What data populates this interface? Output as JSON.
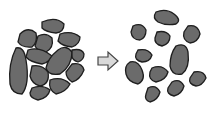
{
  "illustration": {
    "description": "Crowded cluster of gray blob characters transforms into spaced-apart smiling blobs",
    "left_group": {
      "label": "crowded-cells",
      "count": 13
    },
    "arrow": {
      "direction": "right"
    },
    "right_group": {
      "label": "separated-cells",
      "count": 12
    }
  },
  "colors": {
    "blob_fill": "#6b6b6b",
    "blob_stroke": "#1e1e1e",
    "arrow_fill": "#d9d9d9",
    "background": "#ffffff"
  }
}
